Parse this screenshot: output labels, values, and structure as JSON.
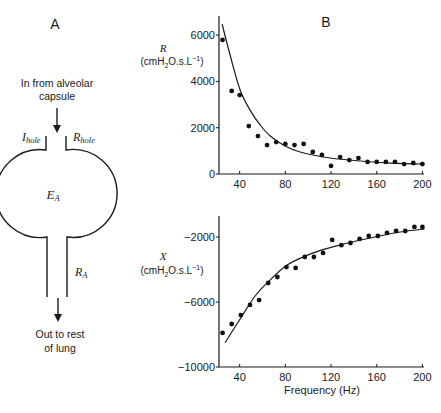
{
  "panel_a": {
    "label": "A",
    "inlet_text_line1": "In from alveolar",
    "inlet_text_line2": "capsule",
    "i_hole": {
      "main": "I",
      "sub": "hole"
    },
    "r_hole": {
      "main": "R",
      "sub": "hole"
    },
    "e_a": {
      "main": "E",
      "sub": "A"
    },
    "r_a": {
      "main": "R",
      "sub": "A"
    },
    "outlet_text_line1": "Out to rest",
    "outlet_text_line2": "of lung"
  },
  "panel_b": {
    "label": "B",
    "xlabel": "Frequency (Hz)"
  },
  "chart_data": [
    {
      "type": "scatter",
      "title": "R",
      "xlabel": "Frequency (Hz)",
      "ylabel_symbol": "R",
      "ylabel_units": "(cmH2O.s.L-1)",
      "xlim": [
        22,
        203
      ],
      "ylim": [
        0,
        6800
      ],
      "xticks": [
        40,
        80,
        120,
        160,
        200
      ],
      "yticks": [
        0,
        2000,
        4000,
        6000
      ],
      "grid": false,
      "series": [
        {
          "name": "measured",
          "style": "dots",
          "x": [
            25,
            33,
            40,
            48,
            56,
            64,
            72,
            80,
            88,
            96,
            104,
            112,
            120,
            128,
            136,
            144,
            152,
            160,
            168,
            176,
            184,
            192,
            200
          ],
          "y": [
            5790,
            3590,
            3410,
            2070,
            1640,
            1250,
            1380,
            1300,
            1250,
            1300,
            950,
            820,
            350,
            730,
            600,
            690,
            520,
            520,
            520,
            520,
            430,
            475,
            430
          ]
        },
        {
          "name": "model fit",
          "style": "line",
          "x": [
            24.6,
            31.6,
            40.4,
            49.1,
            57.9,
            66.7,
            79.8,
            93,
            119.3,
            145.6,
            172,
            201.8
          ],
          "y": [
            6480,
            5140,
            3630,
            2760,
            2120,
            1640,
            1210,
            950,
            690,
            560,
            470,
            430
          ]
        }
      ]
    },
    {
      "type": "scatter",
      "title": "X",
      "xlabel": "Frequency (Hz)",
      "ylabel_symbol": "X",
      "ylabel_units": "(cmH2O.s.L-1)",
      "xlim": [
        22,
        203
      ],
      "ylim": [
        -10000,
        -700
      ],
      "xticks": [
        40,
        80,
        120,
        160,
        200
      ],
      "yticks": [
        -10000,
        -6000,
        -2000
      ],
      "grid": false,
      "series": [
        {
          "name": "measured",
          "style": "dots",
          "x": [
            25,
            33,
            41,
            49,
            57,
            65,
            73,
            81,
            89,
            97,
            105,
            113,
            121,
            129,
            137,
            145,
            153,
            161,
            169,
            177,
            185,
            193,
            200
          ],
          "y": [
            -7900,
            -7350,
            -6800,
            -6180,
            -5880,
            -4830,
            -4460,
            -3850,
            -3900,
            -3230,
            -3230,
            -2980,
            -2180,
            -2500,
            -2370,
            -2120,
            -1940,
            -1940,
            -1750,
            -1630,
            -1630,
            -1380,
            -1380
          ]
        },
        {
          "name": "model fit",
          "style": "line",
          "x": [
            27.2,
            40.4,
            53.5,
            64,
            81.6,
            104.4,
            128,
            154.4,
            180.7,
            201.8
          ],
          "y": [
            -8500,
            -7040,
            -5630,
            -4830,
            -3720,
            -2980,
            -2490,
            -2060,
            -1690,
            -1510
          ]
        }
      ]
    }
  ]
}
